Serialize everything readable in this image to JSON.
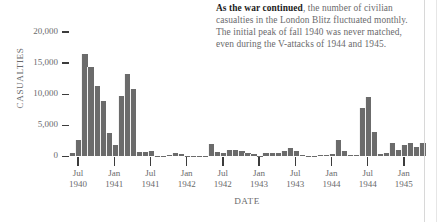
{
  "annotation": {
    "lead": "As the war continued",
    "rest": ", the number of civilian casualties in the London Blitz fluctuated monthly. The initial peak of fall 1940 was never matched, even during the V-attacks of 1944 and 1945."
  },
  "chart_data": {
    "type": "bar",
    "title": "",
    "xlabel": "DATE",
    "ylabel": "CASUALTIES",
    "ylim": [
      0,
      20000
    ],
    "ytick_labels": [
      "20,000",
      "15,000",
      "10,000",
      "5,000",
      "0"
    ],
    "ytick_values": [
      20000,
      15000,
      10000,
      5000,
      0
    ],
    "grid": false,
    "legend": "none",
    "bar_color": "#6b6b6b",
    "xtick_labels": [
      "Jul\n1940",
      "Jan\n1941",
      "Jul\n1941",
      "Jan\n1942",
      "Jul\n1942",
      "Jan\n1943",
      "Jul\n1943",
      "Jan\n1944",
      "Jul\n1944",
      "Jan\n1945"
    ],
    "xtick_months": [
      "Jul 1940",
      "Jan 1941",
      "Jul 1941",
      "Jan 1942",
      "Jul 1942",
      "Jan 1943",
      "Jul 1943",
      "Jan 1944",
      "Jul 1944",
      "Jan 1945"
    ],
    "categories": [
      "Jun 1940",
      "Jul 1940",
      "Aug 1940",
      "Sep 1940",
      "Oct 1940",
      "Nov 1940",
      "Dec 1940",
      "Jan 1941",
      "Feb 1941",
      "Mar 1941",
      "Apr 1941",
      "May 1941",
      "Jun 1941",
      "Jul 1941",
      "Aug 1941",
      "Sep 1941",
      "Oct 1941",
      "Nov 1941",
      "Dec 1941",
      "Jan 1942",
      "Feb 1942",
      "Mar 1942",
      "Apr 1942",
      "May 1942",
      "Jun 1942",
      "Jul 1942",
      "Aug 1942",
      "Sep 1942",
      "Oct 1942",
      "Nov 1942",
      "Dec 1942",
      "Jan 1943",
      "Feb 1943",
      "Mar 1943",
      "Apr 1943",
      "May 1943",
      "Jun 1943",
      "Jul 1943",
      "Aug 1943",
      "Sep 1943",
      "Oct 1943",
      "Nov 1943",
      "Dec 1943",
      "Jan 1944",
      "Feb 1944",
      "Mar 1944",
      "Apr 1944",
      "May 1944",
      "Jun 1944",
      "Jul 1944",
      "Aug 1944",
      "Sep 1944",
      "Oct 1944",
      "Nov 1944",
      "Dec 1944",
      "Jan 1945",
      "Feb 1945",
      "Mar 1945",
      "Apr 1945"
    ],
    "values": [
      480,
      2600,
      16500,
      14300,
      11300,
      8900,
      3700,
      1900,
      9700,
      13300,
      10800,
      700,
      650,
      900,
      120,
      100,
      180,
      480,
      420,
      60,
      70,
      120,
      40,
      2000,
      750,
      600,
      1050,
      1100,
      800,
      600,
      400,
      90,
      520,
      600,
      500,
      900,
      1350,
      900,
      300,
      100,
      60,
      220,
      180,
      400,
      2600,
      800,
      250,
      180,
      7800,
      9500,
      4000,
      420,
      500,
      2150,
      1100,
      1800,
      2100,
      1500,
      2100
    ]
  }
}
